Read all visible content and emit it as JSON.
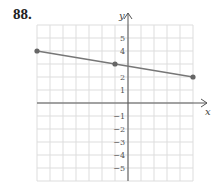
{
  "problem_number": "88.",
  "chart_data": {
    "type": "line",
    "title": "",
    "xlabel": "x",
    "ylabel": "y",
    "xlim": [
      -7,
      5
    ],
    "ylim": [
      -6,
      6
    ],
    "grid": true,
    "y_tick_labels": [
      "5",
      "4",
      "2",
      "1",
      "-1",
      "-2",
      "-3",
      "-4",
      "-5"
    ],
    "series": [
      {
        "name": "line",
        "points": [
          [
            -7,
            4
          ],
          [
            -1,
            3
          ],
          [
            5,
            2
          ]
        ],
        "marked_points": [
          [
            -7,
            4
          ],
          [
            -1,
            3
          ],
          [
            5,
            2
          ]
        ]
      }
    ],
    "colors": {
      "line": "#777777",
      "grid": "#dddddd",
      "axis": "#555555"
    }
  }
}
